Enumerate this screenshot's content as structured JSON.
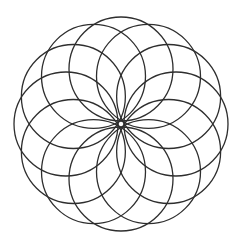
{
  "figure": {
    "type": "circle-rosette",
    "background": "#ffffff",
    "stroke_color": "#2e2e2e",
    "stroke_width": 1.3,
    "center": [
      121,
      124
    ],
    "circle_count": 12,
    "circle_radius": 52,
    "offset_distance": 55,
    "start_angle_deg": 0
  }
}
